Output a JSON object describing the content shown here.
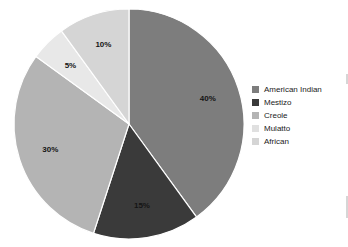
{
  "chart_data": {
    "type": "pie",
    "title": "",
    "categories": [
      "American Indian",
      "Mestizo",
      "Creole",
      "Mulatto",
      "African"
    ],
    "values": [
      40,
      15,
      30,
      5,
      10
    ],
    "labels": [
      "40%",
      "15%",
      "30%",
      "5%",
      "10%"
    ],
    "colors": [
      "#7d7d7d",
      "#3a3a3a",
      "#b4b4b4",
      "#e8e8e8",
      "#d5d5d5"
    ],
    "start_angle_deg": 0,
    "direction": "clockwise",
    "legend_position": "right",
    "grid": false,
    "slice_separator_color": "#ffffff",
    "background": "#ffffff"
  },
  "legend": {
    "entries": [
      {
        "label": "American Indian",
        "color": "#7d7d7d"
      },
      {
        "label": "Mestizo",
        "color": "#3a3a3a"
      },
      {
        "label": "Creole",
        "color": "#b4b4b4"
      },
      {
        "label": "Mulatto",
        "color": "#e0e0e0"
      },
      {
        "label": "African",
        "color": "#d5d5d5"
      }
    ]
  },
  "geometry": {
    "center_x": 129,
    "center_y": 124,
    "radius": 115,
    "label_radius_ratio": 0.72
  }
}
